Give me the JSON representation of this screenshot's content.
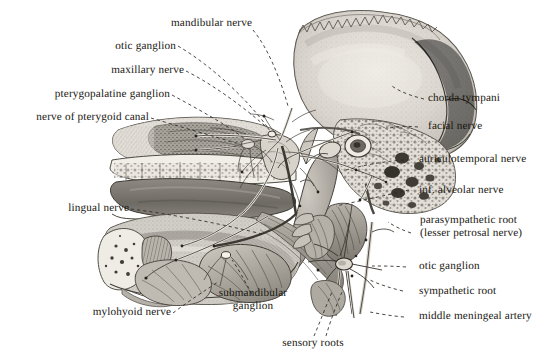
{
  "plate": {
    "title": "Infratemporal region dissection with otic ganglion inset",
    "background_color": "#ffffff",
    "ink_color": "#18160f",
    "width": 560,
    "height": 358
  },
  "labels": {
    "mandibular_nerve": "mandibular nerve",
    "otic_ganglion_top": "otic ganglion",
    "maxillary_nerve": "maxillary nerve",
    "pterygopalatine_ganglion": "pterygopalatine ganglion",
    "nerve_of_pterygoid_canal": "nerve of pterygoid canal",
    "lingual_nerve": "lingual nerve",
    "mylohyoid_nerve": "mylohyoid nerve",
    "submandibular_ganglion_line1": "submandibular",
    "submandibular_ganglion_line2": "ganglion",
    "sensory_roots": "sensory roots",
    "chorda_tympani": "chorda tympani",
    "facial_nerve": "facial nerve",
    "auriculotemporal_nerve": "auriculotemporal nerve",
    "inf_alveolar_nerve": "inf. alveolar nerve",
    "parasympathetic_root_line1": "parasympathetic root",
    "parasympathetic_root_line2": "(lesser petrosal nerve)",
    "otic_ganglion_inset": "otic ganglion",
    "sympathetic_root": "sympathetic root",
    "middle_meningeal_artery": "middle meningeal artery"
  },
  "figure": {
    "main_specimen": "sagittal hemisection of skull showing maxilla, palate, teeth, mandible and infratemporal nerve plexus",
    "inset_specimen": "enlarged otic ganglion with its roots"
  }
}
